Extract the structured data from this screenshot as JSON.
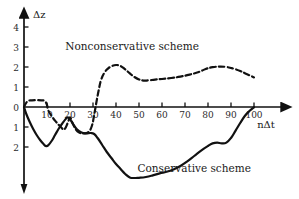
{
  "chart_data": {
    "type": "line",
    "title": "",
    "xlabel": "nΔt",
    "ylabel": "Δz",
    "xlim": [
      0,
      104
    ],
    "ylim": [
      -4.3,
      4.6
    ],
    "grid": false,
    "legend_position": "inline-annotation",
    "xticks": [
      10,
      20,
      30,
      40,
      50,
      60,
      70,
      80,
      90,
      100
    ],
    "xtick_labels": [
      "10",
      "20",
      "30",
      "40",
      "50",
      "60",
      "70",
      "80",
      "90",
      "100"
    ],
    "yticks": [
      4,
      3,
      2,
      1,
      0,
      -1,
      -2
    ],
    "ytick_labels": [
      "4",
      "3",
      "2",
      "1",
      "0",
      "1",
      "2"
    ],
    "annotations": [
      {
        "text": "Nonconservative scheme",
        "x": 47,
        "y": 3.0
      },
      {
        "text": "Conservative scheme",
        "x": 74,
        "y": -3.1
      }
    ],
    "series": [
      {
        "name": "Nonconservative scheme",
        "style": "dashed",
        "color": "#111111",
        "points": [
          [
            0,
            0.0
          ],
          [
            1.5,
            0.28
          ],
          [
            3.5,
            0.33
          ],
          [
            5.5,
            0.34
          ],
          [
            7.5,
            0.33
          ],
          [
            9.0,
            0.3
          ],
          [
            10.0,
            0.1
          ],
          [
            10.5,
            -0.15
          ],
          [
            12.0,
            -0.45
          ],
          [
            14.0,
            -0.75
          ],
          [
            16.0,
            -1.0
          ],
          [
            17.5,
            -1.12
          ],
          [
            19.0,
            -0.8
          ],
          [
            20.0,
            -0.52
          ],
          [
            21.0,
            -0.78
          ],
          [
            22.5,
            -1.12
          ],
          [
            24.0,
            -1.28
          ],
          [
            26.0,
            -1.32
          ],
          [
            28.0,
            -1.25
          ],
          [
            29.5,
            -0.95
          ],
          [
            30.5,
            -0.4
          ],
          [
            31.5,
            0.25
          ],
          [
            32.5,
            0.85
          ],
          [
            33.5,
            1.35
          ],
          [
            35.0,
            1.72
          ],
          [
            36.5,
            1.92
          ],
          [
            38.0,
            2.03
          ],
          [
            40.0,
            2.1
          ],
          [
            42.0,
            2.05
          ],
          [
            44.0,
            1.88
          ],
          [
            46.0,
            1.68
          ],
          [
            48.0,
            1.5
          ],
          [
            50.0,
            1.38
          ],
          [
            52.0,
            1.32
          ],
          [
            54.0,
            1.33
          ],
          [
            57.0,
            1.37
          ],
          [
            60.0,
            1.4
          ],
          [
            64.0,
            1.45
          ],
          [
            68.0,
            1.52
          ],
          [
            72.0,
            1.62
          ],
          [
            76.0,
            1.75
          ],
          [
            79.0,
            1.9
          ],
          [
            82.0,
            1.99
          ],
          [
            85.0,
            2.02
          ],
          [
            88.0,
            2.0
          ],
          [
            91.0,
            1.92
          ],
          [
            94.0,
            1.8
          ],
          [
            97.0,
            1.64
          ],
          [
            100.0,
            1.48
          ]
        ]
      },
      {
        "name": "Conservative scheme",
        "style": "solid",
        "color": "#111111",
        "points": [
          [
            0,
            0.0
          ],
          [
            1.0,
            -0.35
          ],
          [
            2.5,
            -0.75
          ],
          [
            4.0,
            -1.1
          ],
          [
            5.5,
            -1.4
          ],
          [
            7.0,
            -1.65
          ],
          [
            8.5,
            -1.85
          ],
          [
            9.5,
            -1.95
          ],
          [
            10.5,
            -1.92
          ],
          [
            12.0,
            -1.7
          ],
          [
            13.5,
            -1.4
          ],
          [
            15.0,
            -1.1
          ],
          [
            16.5,
            -0.85
          ],
          [
            18.0,
            -0.62
          ],
          [
            19.0,
            -0.52
          ],
          [
            20.0,
            -0.62
          ],
          [
            21.5,
            -0.88
          ],
          [
            23.0,
            -1.12
          ],
          [
            25.0,
            -1.28
          ],
          [
            27.0,
            -1.32
          ],
          [
            29.0,
            -1.3
          ],
          [
            30.5,
            -1.35
          ],
          [
            32.0,
            -1.55
          ],
          [
            34.0,
            -1.9
          ],
          [
            36.0,
            -2.25
          ],
          [
            38.0,
            -2.55
          ],
          [
            40.0,
            -2.85
          ],
          [
            42.0,
            -3.1
          ],
          [
            44.0,
            -3.35
          ],
          [
            46.0,
            -3.52
          ],
          [
            48.0,
            -3.55
          ],
          [
            50.0,
            -3.54
          ],
          [
            53.0,
            -3.5
          ],
          [
            56.0,
            -3.42
          ],
          [
            59.0,
            -3.32
          ],
          [
            62.0,
            -3.24
          ],
          [
            65.0,
            -3.12
          ],
          [
            68.0,
            -2.95
          ],
          [
            71.0,
            -2.72
          ],
          [
            74.0,
            -2.45
          ],
          [
            77.0,
            -2.18
          ],
          [
            80.0,
            -1.95
          ],
          [
            82.0,
            -1.82
          ],
          [
            84.0,
            -1.78
          ],
          [
            86.0,
            -1.82
          ],
          [
            88.0,
            -1.78
          ],
          [
            90.0,
            -1.55
          ],
          [
            92.0,
            -1.18
          ],
          [
            94.0,
            -0.8
          ],
          [
            96.0,
            -0.45
          ],
          [
            98.0,
            -0.2
          ],
          [
            100.0,
            -0.02
          ]
        ]
      }
    ]
  },
  "axes": {
    "y_label": "Δz",
    "x_label": "nΔt",
    "x_tick_labels": [
      "10",
      "20",
      "30",
      "40",
      "50",
      "60",
      "70",
      "80",
      "90",
      "100"
    ],
    "y_tick_labels": [
      "4",
      "3",
      "2",
      "1",
      "0",
      "1",
      "2"
    ]
  },
  "labels": {
    "nonconservative": "Nonconservative scheme",
    "conservative": "Conservative scheme"
  },
  "colors": {
    "ink": "#111111",
    "background": "#ffffff"
  }
}
